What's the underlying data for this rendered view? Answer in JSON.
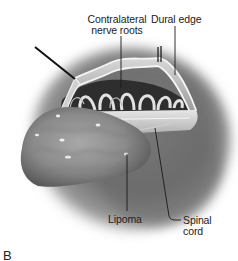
{
  "figure": {
    "panel_letter": "B",
    "labels": {
      "contralateral_nerve_roots": [
        "Contralateral",
        "nerve roots"
      ],
      "dural_edge": "Dural edge",
      "lipoma": "Lipoma",
      "spinal_cord": [
        "Spinal",
        "cord"
      ]
    },
    "colors": {
      "background": "#ffffff",
      "label_text": "#222222",
      "leader_line": "#1a1a1a"
    }
  }
}
